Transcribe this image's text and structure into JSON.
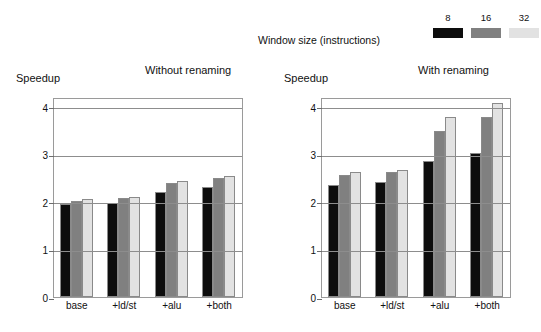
{
  "legend": {
    "title": "Window size (instructions)",
    "entries": [
      {
        "label": "8",
        "color": "#0d0d0d"
      },
      {
        "label": "16",
        "color": "#808080"
      },
      {
        "label": "32",
        "color": "#e2e2e2"
      }
    ]
  },
  "chart_data": [
    {
      "type": "bar",
      "title": "Without renaming",
      "xlabel": "",
      "ylabel": "Speedup",
      "ylim": [
        0,
        4.2
      ],
      "yticks": [
        0,
        1,
        2,
        3,
        4
      ],
      "grid": true,
      "legend_position": "top-right",
      "categories": [
        "base",
        "+ld/st",
        "+alu",
        "+both"
      ],
      "series": [
        {
          "name": "8",
          "color": "#0d0d0d",
          "values": [
            1.96,
            1.98,
            2.2,
            2.3
          ]
        },
        {
          "name": "16",
          "color": "#808080",
          "values": [
            2.02,
            2.08,
            2.4,
            2.5
          ]
        },
        {
          "name": "32",
          "color": "#e2e2e2",
          "values": [
            2.06,
            2.1,
            2.43,
            2.55
          ]
        }
      ]
    },
    {
      "type": "bar",
      "title": "With renaming",
      "xlabel": "",
      "ylabel": "Speedup",
      "ylim": [
        0,
        4.2
      ],
      "yticks": [
        0,
        1,
        2,
        3,
        4
      ],
      "grid": true,
      "legend_position": "top-right",
      "categories": [
        "base",
        "+ld/st",
        "+alu",
        "+both"
      ],
      "series": [
        {
          "name": "8",
          "color": "#0d0d0d",
          "values": [
            2.35,
            2.42,
            2.85,
            3.02
          ]
        },
        {
          "name": "16",
          "color": "#808080",
          "values": [
            2.57,
            2.63,
            3.48,
            3.77
          ]
        },
        {
          "name": "32",
          "color": "#e2e2e2",
          "values": [
            2.63,
            2.67,
            3.77,
            4.08
          ]
        }
      ]
    }
  ]
}
